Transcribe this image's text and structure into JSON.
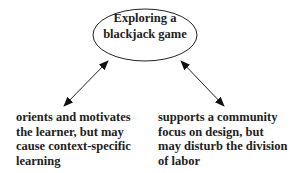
{
  "center_node": {
    "lines": [
      "Exploring a",
      "blackjack game"
    ]
  },
  "left_note": {
    "lines": [
      "orients and motivates",
      "the learner, but may",
      "cause context-specific",
      "learning"
    ]
  },
  "right_note": {
    "lines": [
      "supports a community",
      "focus on design, but",
      "may disturb the division",
      "of labor"
    ]
  },
  "colors": {
    "stroke": "#222222",
    "text": "#222222",
    "background": "#ffffff"
  }
}
